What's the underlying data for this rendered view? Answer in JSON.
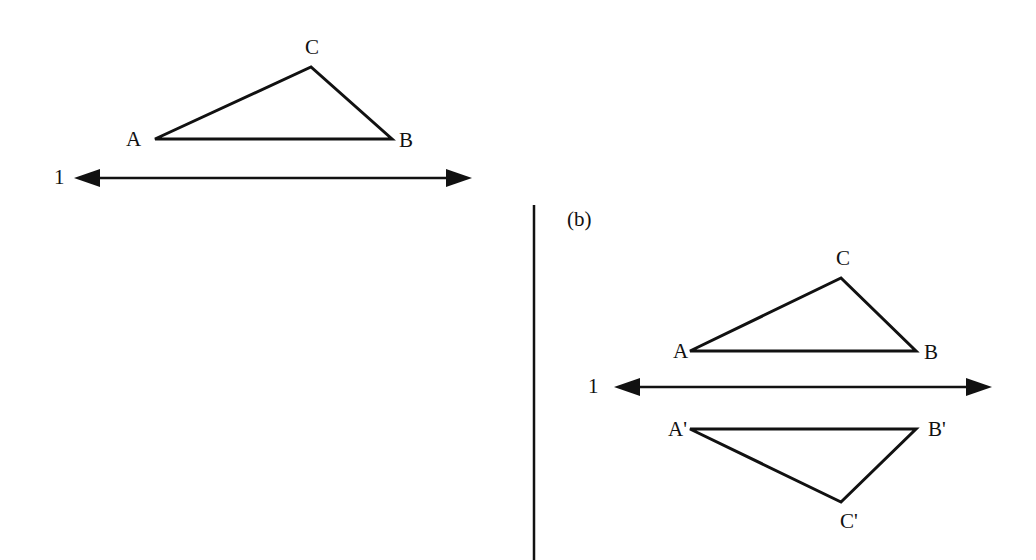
{
  "diagram": {
    "colors": {
      "ink": "#111111",
      "background": "#ffffff"
    },
    "panel_a": {
      "line_label": "1",
      "vertices": [
        {
          "label": "A",
          "x": 155,
          "y": 139
        },
        {
          "label": "B",
          "x": 392,
          "y": 139
        },
        {
          "label": "C",
          "x": 311,
          "y": 67
        }
      ],
      "line": {
        "x1": 74,
        "x2": 472,
        "y": 178
      }
    },
    "divider": {
      "x": 534,
      "y1": 205,
      "y2": 560
    },
    "panel_b": {
      "caption": "(b)",
      "line_label": "1",
      "vertices": [
        {
          "label": "A",
          "x": 690,
          "y": 351
        },
        {
          "label": "B",
          "x": 916,
          "y": 351
        },
        {
          "label": "C",
          "x": 841,
          "y": 278
        }
      ],
      "image_vertices": [
        {
          "label": "A'",
          "x": 690,
          "y": 429
        },
        {
          "label": "B'",
          "x": 916,
          "y": 429
        },
        {
          "label": "C'",
          "x": 841,
          "y": 502
        }
      ],
      "line": {
        "x1": 614,
        "x2": 992,
        "y": 387
      }
    }
  }
}
